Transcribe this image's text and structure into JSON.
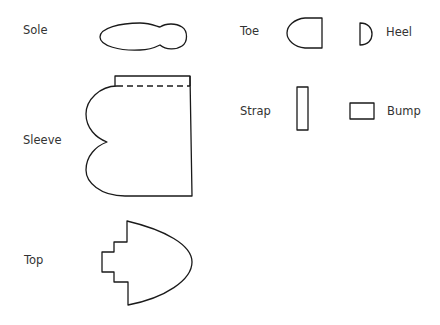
{
  "pieces": [
    {
      "id": "sole",
      "label": "Sole"
    },
    {
      "id": "toe",
      "label": "Toe"
    },
    {
      "id": "heel",
      "label": "Heel"
    },
    {
      "id": "sleeve",
      "label": "Sleeve"
    },
    {
      "id": "strap",
      "label": "Strap"
    },
    {
      "id": "bump",
      "label": "Bump"
    },
    {
      "id": "top",
      "label": "Top"
    }
  ],
  "colors": {
    "line": "#1a1a1a",
    "text": "#333333",
    "background": "#ffffff"
  }
}
